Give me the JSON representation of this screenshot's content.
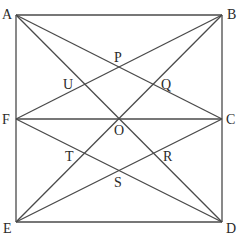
{
  "diagram": {
    "type": "geometry",
    "stroke_color": "#4a4a4a",
    "label_color": "#2a2a2a",
    "points": {
      "A": {
        "label": "A",
        "x": 16,
        "y": 15
      },
      "B": {
        "label": "B",
        "x": 222,
        "y": 15
      },
      "C": {
        "label": "C",
        "x": 222,
        "y": 119
      },
      "D": {
        "label": "D",
        "x": 222,
        "y": 222
      },
      "E": {
        "label": "E",
        "x": 16,
        "y": 222
      },
      "F": {
        "label": "F",
        "x": 16,
        "y": 119
      },
      "O": {
        "label": "O",
        "x": 119,
        "y": 119
      },
      "P": {
        "label": "P",
        "x": 119,
        "y": 67
      },
      "Q": {
        "label": "Q",
        "x": 153,
        "y": 85
      },
      "R": {
        "label": "R",
        "x": 153,
        "y": 153
      },
      "S": {
        "label": "S",
        "x": 119,
        "y": 171
      },
      "T": {
        "label": "T",
        "x": 85,
        "y": 153
      },
      "U": {
        "label": "U",
        "x": 85,
        "y": 85
      }
    },
    "segments": [
      [
        "A",
        "B"
      ],
      [
        "B",
        "D"
      ],
      [
        "A",
        "E"
      ],
      [
        "E",
        "D"
      ],
      [
        "F",
        "C"
      ],
      [
        "A",
        "D"
      ],
      [
        "B",
        "E"
      ],
      [
        "A",
        "C"
      ],
      [
        "F",
        "B"
      ],
      [
        "F",
        "D"
      ],
      [
        "E",
        "C"
      ]
    ],
    "labels": {
      "A": "A",
      "B": "B",
      "C": "C",
      "D": "D",
      "E": "E",
      "F": "F",
      "O": "O",
      "P": "P",
      "Q": "Q",
      "R": "R",
      "S": "S",
      "T": "T",
      "U": "U"
    }
  }
}
